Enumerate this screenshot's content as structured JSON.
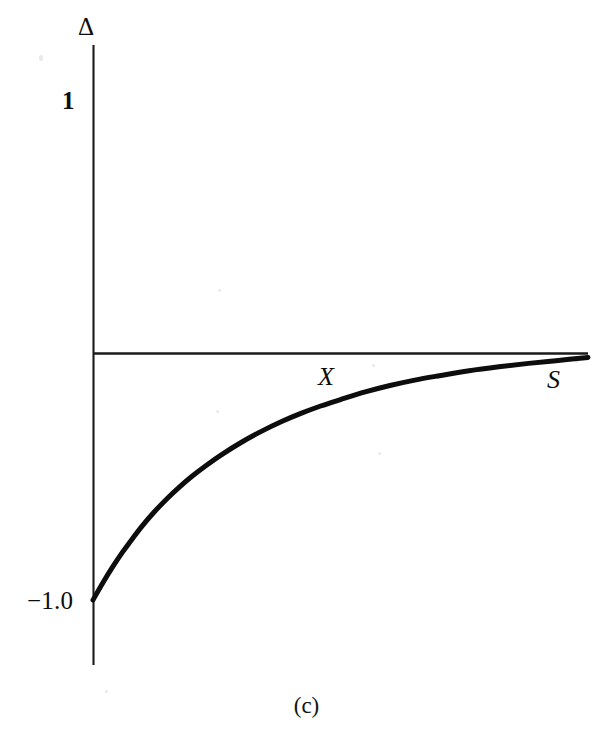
{
  "figure": {
    "caption": "(c)",
    "background_color": "#ffffff",
    "ink_color": "#0d0d0d"
  },
  "axes": {
    "y_axis_label": "Δ",
    "y_axis_label_name": "delta",
    "x_axis_label": "S",
    "x_axis_label_name": "underlying-price",
    "y_ticks": [
      {
        "label": "1",
        "value": 1
      },
      {
        "label": "−1.0",
        "value": -1
      }
    ],
    "x_annotations": [
      {
        "label": "X",
        "meaning": "strike-price"
      }
    ],
    "y_axis_color": "#1a1a1a",
    "x_axis_color": "#1a1a1a",
    "grid": false,
    "legend": false
  },
  "chart_data": {
    "type": "line",
    "title": "",
    "subtitle": "",
    "xlabel": "S",
    "ylabel": "Δ",
    "xlim": [
      0,
      1
    ],
    "ylim": [
      -1.25,
      1.25
    ],
    "grid": false,
    "legend_position": "none",
    "annotations": [
      {
        "text": "X",
        "x": 0.475,
        "y": -0.05,
        "note": "strike price marker on the zero line"
      },
      {
        "text": "S",
        "x": 0.935,
        "y": -0.06,
        "note": "underlying price axis label"
      },
      {
        "text": "(c)",
        "x": 0.48,
        "y": -1.42,
        "note": "panel caption below the figure"
      }
    ],
    "series": [
      {
        "name": "Delta of short call / long put",
        "color": "#0d0d0d",
        "line_width": 5,
        "x": [
          0.0,
          0.02,
          0.04,
          0.06,
          0.08,
          0.1,
          0.125,
          0.15,
          0.175,
          0.2,
          0.23,
          0.26,
          0.3,
          0.34,
          0.38,
          0.42,
          0.46,
          0.5,
          0.55,
          0.6,
          0.65,
          0.7,
          0.76,
          0.82,
          0.88,
          0.94,
          1.0
        ],
        "values": [
          -1.0,
          -0.93,
          -0.865,
          -0.805,
          -0.75,
          -0.698,
          -0.64,
          -0.588,
          -0.541,
          -0.498,
          -0.452,
          -0.41,
          -0.36,
          -0.316,
          -0.277,
          -0.243,
          -0.213,
          -0.187,
          -0.156,
          -0.13,
          -0.108,
          -0.09,
          -0.07,
          -0.054,
          -0.04,
          -0.028,
          -0.016
        ]
      }
    ],
    "zero_line": {
      "value": 0,
      "drawn": true,
      "color": "#1a1a1a",
      "width": 2
    }
  }
}
